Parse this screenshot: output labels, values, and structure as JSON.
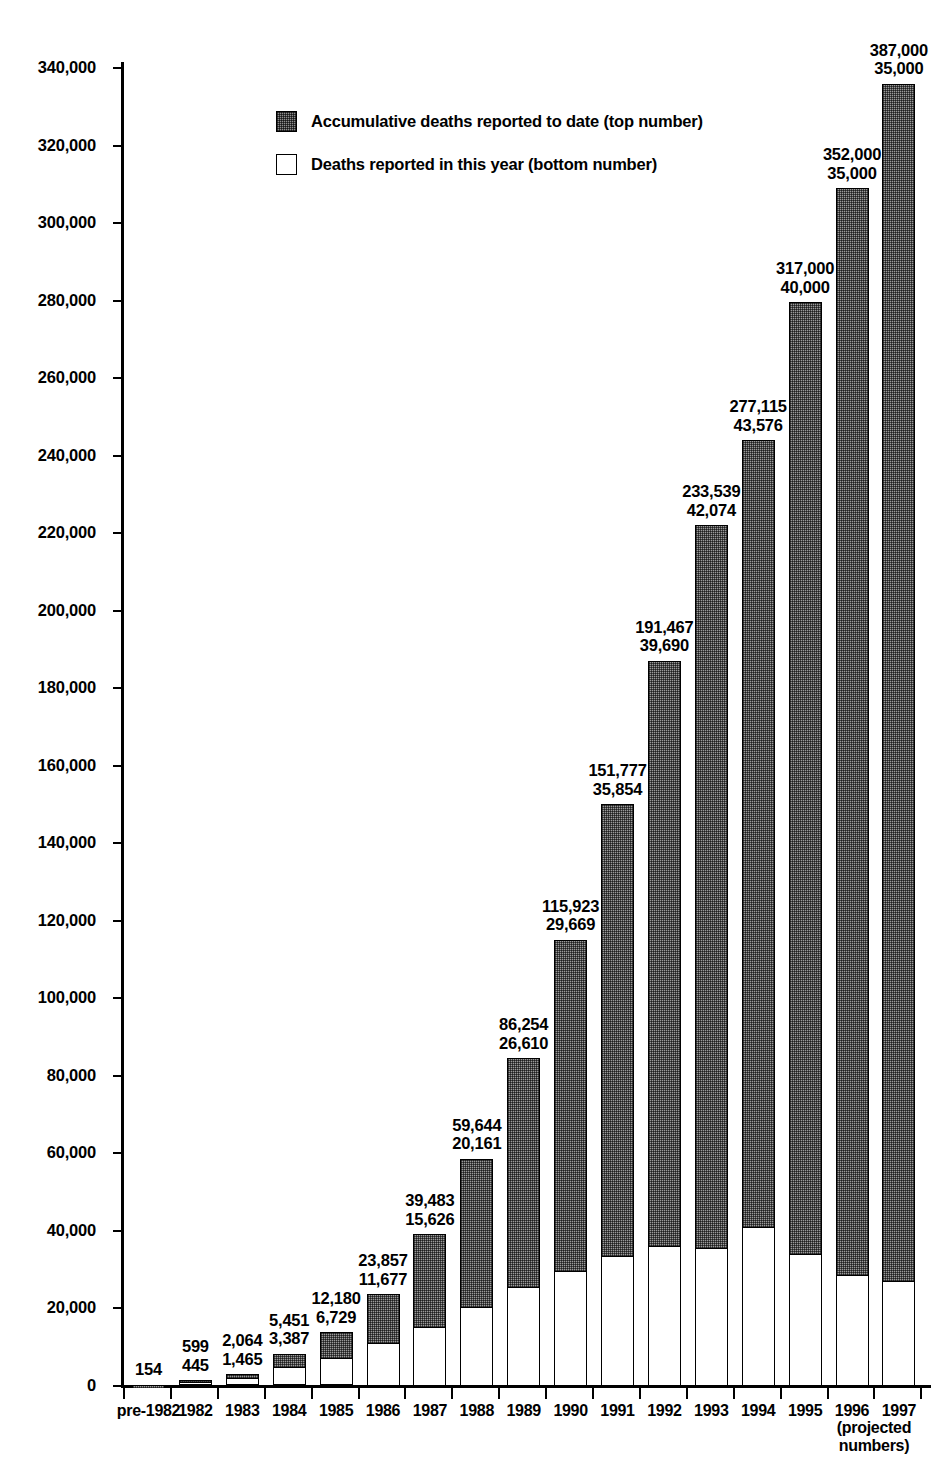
{
  "chart_data": {
    "type": "bar",
    "subtype": "stacked",
    "title": "",
    "xlabel": "",
    "ylabel": "",
    "ylim": [
      0,
      345000
    ],
    "grid": false,
    "legend_position": "inside-top-left",
    "y_ticks": [
      "0",
      "20,000",
      "40,000",
      "60,000",
      "80,000",
      "100,000",
      "120,000",
      "140,000",
      "160,000",
      "180,000",
      "200,000",
      "220,000",
      "240,000",
      "260,000",
      "280,000",
      "300,000",
      "320,000",
      "340,000"
    ],
    "y_tick_values": [
      0,
      20000,
      40000,
      60000,
      80000,
      100000,
      120000,
      140000,
      160000,
      180000,
      200000,
      220000,
      240000,
      260000,
      280000,
      300000,
      320000,
      340000
    ],
    "categories": [
      "pre-1982",
      "1982",
      "1983",
      "1984",
      "1985",
      "1986",
      "1987",
      "1988",
      "1989",
      "1990",
      "1991",
      "1992",
      "1993",
      "1994",
      "1995",
      "1996",
      "1997"
    ],
    "series": [
      {
        "name": "Accumulative deaths reported to date (top number)",
        "key": "cumulative",
        "color": "#8f8f8f",
        "pattern": "stipple",
        "values": [
          154,
          599,
          2064,
          5451,
          12180,
          23857,
          39483,
          59644,
          86254,
          115923,
          151777,
          191467,
          233539,
          277115,
          317000,
          352000,
          387000
        ]
      },
      {
        "name": "Deaths reported in this year (bottom number)",
        "key": "annual",
        "color": "#ffffff",
        "pattern": "solid",
        "values": [
          154,
          445,
          1465,
          3387,
          6729,
          11677,
          15626,
          20161,
          26610,
          29669,
          35854,
          39690,
          42074,
          43576,
          40000,
          35000,
          35000
        ]
      }
    ],
    "bar_labels_top": [
      "154",
      "599",
      "2,064",
      "5,451",
      "12,180",
      "23,857",
      "39,483",
      "59,644",
      "86,254",
      "115,923",
      "151,777",
      "191,467",
      "233,539",
      "277,115",
      "317,000",
      "352,000",
      "387,000"
    ],
    "bar_labels_bottom": [
      "",
      "445",
      "1,465",
      "3,387",
      "6,729",
      "11,677",
      "15,626",
      "20,161",
      "26,610",
      "29,669",
      "35,854",
      "39,690",
      "42,074",
      "43,576",
      "40,000",
      "35,000",
      "35,000"
    ],
    "drawn_bar_totals": [
      154,
      1300,
      2900,
      8200,
      13800,
      23500,
      39000,
      58500,
      84500,
      115000,
      150000,
      187000,
      222000,
      244000,
      279500,
      309000,
      336000
    ],
    "drawn_bar_annual": [
      154,
      900,
      1900,
      4700,
      7100,
      11000,
      15200,
      20300,
      25500,
      29500,
      33500,
      36000,
      35500,
      41000,
      34000,
      28500,
      27000
    ],
    "annotation_projected": "(projected\nnumbers)",
    "annotation_projected_line1": "(projected",
    "annotation_projected_line2": "numbers)"
  },
  "legend": {
    "items": [
      {
        "label": "Accumulative deaths reported to date (top number)",
        "swatch": "hatched"
      },
      {
        "label": "Deaths reported in this year (bottom number)",
        "swatch": "white"
      }
    ]
  }
}
